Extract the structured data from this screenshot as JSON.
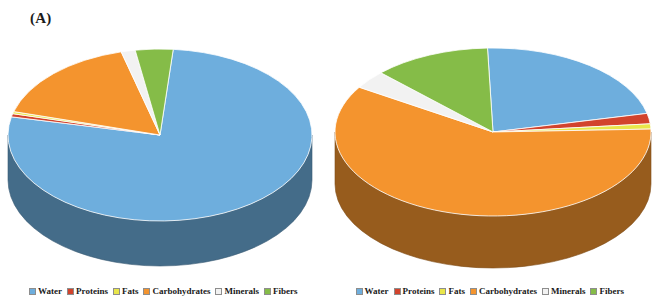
{
  "figure": {
    "background": "#ffffff"
  },
  "panels": [
    {
      "label": "(A)"
    },
    {
      "label": "(B)"
    }
  ],
  "legend": {
    "items": [
      {
        "label": "Water",
        "color": "#6EAEDD"
      },
      {
        "label": "Proteins",
        "color": "#D2432C"
      },
      {
        "label": "Fats",
        "color": "#E9E64A"
      },
      {
        "label": "Carbohydrates",
        "color": "#F4942E"
      },
      {
        "label": "Minerals",
        "color": "#F2F2F2"
      },
      {
        "label": "Fibers",
        "color": "#85BC48"
      }
    ]
  },
  "colors": {
    "water": "#6EAEDD",
    "proteins": "#D2432C",
    "fats": "#E9E64A",
    "carbohydrates": "#F4942E",
    "minerals": "#F2F2F2",
    "fibers": "#85BC48",
    "water_side": "#2F5573",
    "carbohydrates_side": "#9A5D2A",
    "proteins_side": "#8A2C1C",
    "fats_side": "#A09A28",
    "minerals_side": "#B8B8B8",
    "fibers_side": "#55802C"
  },
  "chart_data": [
    {
      "type": "pie",
      "title": "(A)",
      "labels": [
        "Water",
        "Proteins",
        "Fats",
        "Carbohydrates",
        "Minerals",
        "Fibers"
      ],
      "values": [
        77.0,
        0.6,
        0.4,
        16.5,
        1.5,
        4.0
      ],
      "unit": "%",
      "colors": [
        "#6EAEDD",
        "#D2432C",
        "#E9E64A",
        "#F4942E",
        "#F2F2F2",
        "#85BC48"
      ],
      "three_d": true,
      "start_angle": 0,
      "legend_position": "bottom"
    },
    {
      "type": "pie",
      "title": "(B)",
      "labels": [
        "Water",
        "Proteins",
        "Fats",
        "Carbohydrates",
        "Minerals",
        "Fibers"
      ],
      "values": [
        22.0,
        2.0,
        1.0,
        59.5,
        3.5,
        12.0
      ],
      "unit": "%",
      "colors": [
        "#6EAEDD",
        "#D2432C",
        "#E9E64A",
        "#F4942E",
        "#F2F2F2",
        "#85BC48"
      ],
      "three_d": true,
      "start_angle": 0,
      "legend_position": "bottom"
    }
  ]
}
